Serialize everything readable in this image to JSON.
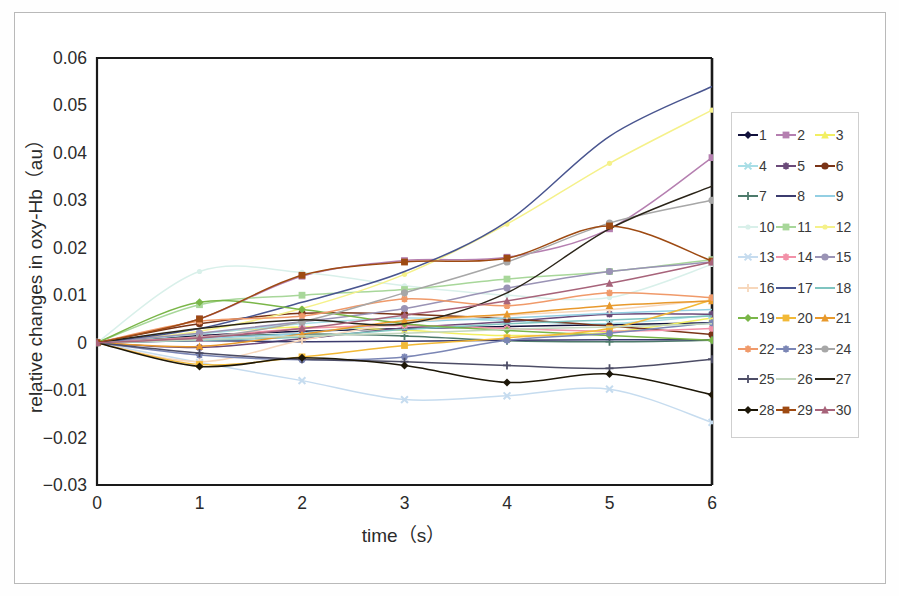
{
  "figure": {
    "background": "#ffffff",
    "border_color": "#b9b9b9",
    "axis_color": "#1a1a1a"
  },
  "chart_data": {
    "type": "line",
    "title": "",
    "xlabel": "time（s）",
    "ylabel": "relative changes in oxy-Hb（au）",
    "x": [
      0,
      1,
      2,
      3,
      4,
      5,
      6
    ],
    "xlim": [
      0,
      6
    ],
    "ylim": [
      -0.03,
      0.06
    ],
    "xticks": [
      "0",
      "1",
      "2",
      "3",
      "4",
      "5",
      "6"
    ],
    "yticks": [
      "0.06",
      "0.05",
      "0.04",
      "0.03",
      "0.02",
      "0.01",
      "0",
      "−0.01",
      "−0.02",
      "−0.03"
    ],
    "ytick_values": [
      0.06,
      0.05,
      0.04,
      0.03,
      0.02,
      0.01,
      0,
      -0.01,
      -0.02,
      -0.03
    ],
    "grid": false,
    "legend_position": "right-outside",
    "legend_title": "",
    "series": [
      {
        "name": "1",
        "color": "#12123c",
        "marker": "diamond",
        "values": [
          0,
          0.0015,
          0.0024,
          0.003,
          0.0034,
          0.0038,
          0.0042
        ]
      },
      {
        "name": "2",
        "color": "#b57fb0",
        "marker": "square",
        "values": [
          0,
          0.005,
          0.014,
          0.0173,
          0.018,
          0.024,
          0.039
        ]
      },
      {
        "name": "3",
        "color": "#f2ef62",
        "marker": "triangle",
        "values": [
          0,
          0.002,
          0.0033,
          0.0026,
          0.0015,
          0.0022,
          0.0052
        ]
      },
      {
        "name": "4",
        "color": "#a8dee6",
        "marker": "cross",
        "values": [
          0,
          0.0018,
          0.004,
          0.0052,
          0.0046,
          0.004,
          0.0058
        ]
      },
      {
        "name": "5",
        "color": "#6b4a79",
        "marker": "star",
        "values": [
          0,
          -0.001,
          0.0008,
          0.0031,
          0.0044,
          0.006,
          0.006
        ]
      },
      {
        "name": "6",
        "color": "#7a3417",
        "marker": "circle",
        "values": [
          0,
          0.004,
          0.0062,
          0.006,
          0.005,
          0.0035,
          0.0017
        ]
      },
      {
        "name": "7",
        "color": "#4d7a6b",
        "marker": "plus",
        "values": [
          0,
          0.0012,
          0.0018,
          0.0014,
          0.0004,
          0.0002,
          0.0005
        ]
      },
      {
        "name": "8",
        "color": "#3b3b6e",
        "marker": "line",
        "values": [
          0,
          0.0004,
          0.0002,
          0.0003,
          0.0005,
          0.0006,
          0.0006
        ]
      },
      {
        "name": "9",
        "color": "#93cfe3",
        "marker": "line",
        "values": [
          0,
          0.0008,
          0.002,
          0.0042,
          0.0052,
          0.0062,
          0.007
        ]
      },
      {
        "name": "10",
        "color": "#d9f0ea",
        "marker": "dot",
        "values": [
          0,
          0.015,
          0.0148,
          0.012,
          0.01,
          0.0095,
          0.0165
        ]
      },
      {
        "name": "11",
        "color": "#a8d79a",
        "marker": "square",
        "values": [
          0,
          0.008,
          0.01,
          0.0112,
          0.0134,
          0.015,
          0.0175
        ]
      },
      {
        "name": "12",
        "color": "#f5f18a",
        "marker": "dot",
        "values": [
          0,
          0.0024,
          0.0072,
          0.0144,
          0.025,
          0.0378,
          0.049
        ]
      },
      {
        "name": "13",
        "color": "#c6dcef",
        "marker": "cross",
        "values": [
          0,
          -0.0042,
          -0.008,
          -0.012,
          -0.0112,
          -0.0098,
          -0.0168
        ]
      },
      {
        "name": "14",
        "color": "#f291a8",
        "marker": "star",
        "values": [
          0,
          0.0012,
          0.003,
          0.0036,
          0.003,
          0.0024,
          0.003
        ]
      },
      {
        "name": "15",
        "color": "#9a93b5",
        "marker": "circle",
        "values": [
          0,
          0.002,
          0.0044,
          0.0072,
          0.0115,
          0.015,
          0.017
        ]
      },
      {
        "name": "16",
        "color": "#f7d7bb",
        "marker": "plus",
        "values": [
          0,
          -0.004,
          0.0005,
          0.0042,
          0.0058,
          0.007,
          0.009
        ]
      },
      {
        "name": "17",
        "color": "#49558f",
        "marker": "line",
        "values": [
          0,
          0.003,
          0.0085,
          0.015,
          0.0255,
          0.0435,
          0.054
        ]
      },
      {
        "name": "18",
        "color": "#7fc4c0",
        "marker": "line",
        "values": [
          0,
          0.0005,
          0.0012,
          0.0028,
          0.004,
          0.0048,
          0.0056
        ]
      },
      {
        "name": "19",
        "color": "#7ab648",
        "marker": "diamond",
        "values": [
          0,
          0.0085,
          0.007,
          0.004,
          0.0026,
          0.0015,
          0.0005
        ]
      },
      {
        "name": "20",
        "color": "#f2b937",
        "marker": "square",
        "values": [
          0,
          -0.0046,
          -0.003,
          -0.0006,
          0.001,
          0.003,
          0.009
        ]
      },
      {
        "name": "21",
        "color": "#e8992c",
        "marker": "triangle",
        "values": [
          0,
          -0.0008,
          0.0018,
          0.0046,
          0.006,
          0.0078,
          0.0088
        ]
      },
      {
        "name": "22",
        "color": "#f09a6a",
        "marker": "star",
        "values": [
          0,
          0.0045,
          0.0056,
          0.0092,
          0.0078,
          0.0105,
          0.0095
        ]
      },
      {
        "name": "23",
        "color": "#7b86b5",
        "marker": "star",
        "values": [
          0,
          -0.0026,
          -0.0036,
          -0.003,
          0.0005,
          0.002,
          0.0042
        ]
      },
      {
        "name": "24",
        "color": "#a7a7a7",
        "marker": "circle",
        "values": [
          0,
          0.001,
          0.0044,
          0.0105,
          0.017,
          0.0252,
          0.03
        ]
      },
      {
        "name": "25",
        "color": "#4d4d66",
        "marker": "plus",
        "values": [
          0,
          -0.0022,
          -0.0035,
          -0.004,
          -0.0048,
          -0.0054,
          -0.0035
        ]
      },
      {
        "name": "26",
        "color": "#c2d6bd",
        "marker": "line",
        "values": [
          0,
          0.0006,
          0.0014,
          0.002,
          0.0028,
          0.0033,
          0.004
        ]
      },
      {
        "name": "27",
        "color": "#2a2418",
        "marker": "line",
        "values": [
          0,
          0.003,
          0.0048,
          0.004,
          0.0105,
          0.024,
          0.033
        ]
      },
      {
        "name": "28",
        "color": "#1d1708",
        "marker": "diamond",
        "values": [
          0,
          -0.005,
          -0.0032,
          -0.0048,
          -0.0084,
          -0.0066,
          -0.011
        ]
      },
      {
        "name": "29",
        "color": "#9e4a12",
        "marker": "square",
        "values": [
          0,
          0.005,
          0.0142,
          0.017,
          0.0178,
          0.0246,
          0.0172
        ]
      },
      {
        "name": "30",
        "color": "#a7637a",
        "marker": "triangle",
        "values": [
          0,
          0.001,
          0.003,
          0.0058,
          0.0088,
          0.0125,
          0.017
        ]
      }
    ]
  }
}
